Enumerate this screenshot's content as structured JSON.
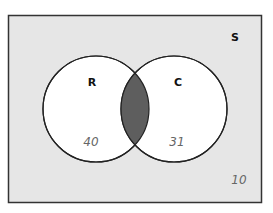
{
  "diagram": {
    "type": "venn",
    "universe_label": "S",
    "sets": [
      {
        "label": "R",
        "only_count": "40"
      },
      {
        "label": "C",
        "only_count": "31"
      }
    ],
    "intersection_shaded": true,
    "outside_count": "10",
    "colors": {
      "universe_fill": "#e6e6e6",
      "circle_fill": "#ffffff",
      "intersection_fill": "#5e5e5e",
      "stroke": "#222222"
    }
  }
}
